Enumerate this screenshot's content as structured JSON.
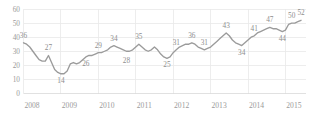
{
  "chart_data": {
    "type": "line",
    "title": "",
    "subtitle": "",
    "xlabel": "",
    "ylabel": "",
    "ylim": [
      0,
      60
    ],
    "ytick_values": [
      0,
      10,
      20,
      30,
      40,
      50,
      60
    ],
    "ytick_labels": [
      "0",
      "10",
      "20",
      "30",
      "40",
      "50",
      "60"
    ],
    "xtick_labels": [
      "2008",
      "2009",
      "2010",
      "2011",
      "2012",
      "2013",
      "2014",
      "2015"
    ],
    "xtick_positions": [
      2008,
      2009,
      2010,
      2011,
      2012,
      2013,
      2014,
      2015
    ],
    "grid": {
      "horizontal": true,
      "vertical": true
    },
    "legend": {
      "visible": false,
      "position": "none"
    },
    "line_color": "#9b9b9b",
    "grid_color": "#e8e8e8",
    "label_color": "#8e8e8e",
    "series": [
      {
        "name": "series-1",
        "x": [
          2008.0,
          2008.083,
          2008.167,
          2008.25,
          2008.333,
          2008.417,
          2008.5,
          2008.583,
          2008.667,
          2008.75,
          2008.833,
          2008.917,
          2009.0,
          2009.083,
          2009.167,
          2009.25,
          2009.333,
          2009.417,
          2009.5,
          2009.583,
          2009.667,
          2009.75,
          2009.833,
          2009.917,
          2010.0,
          2010.083,
          2010.167,
          2010.25,
          2010.333,
          2010.417,
          2010.5,
          2010.583,
          2010.667,
          2010.75,
          2010.833,
          2010.917,
          2011.0,
          2011.083,
          2011.167,
          2011.25,
          2011.333,
          2011.417,
          2011.5,
          2011.583,
          2011.667,
          2011.75,
          2011.833,
          2011.917,
          2012.0,
          2012.083,
          2012.167,
          2012.25,
          2012.333,
          2012.417,
          2012.5,
          2012.583,
          2012.667,
          2012.75,
          2012.833,
          2012.917,
          2013.0,
          2013.083,
          2013.167,
          2013.25,
          2013.333,
          2013.417,
          2013.5,
          2013.583,
          2013.667,
          2013.75,
          2013.833,
          2013.917,
          2014.0,
          2014.083,
          2014.167,
          2014.25,
          2014.333,
          2014.417,
          2014.5,
          2014.583,
          2014.667,
          2014.75,
          2014.833,
          2014.917,
          2015.0,
          2015.083,
          2015.167,
          2015.25,
          2015.333,
          2015.417
        ],
        "values": [
          36,
          35,
          33,
          30,
          27,
          24,
          23,
          23,
          27,
          22,
          17,
          15,
          14,
          14,
          16,
          21,
          22,
          21,
          22,
          24,
          26,
          27,
          27,
          28,
          29,
          29,
          30,
          31,
          33,
          34,
          33,
          32,
          31,
          30,
          30,
          31,
          33,
          35,
          33,
          31,
          30,
          31,
          33,
          31,
          28,
          26,
          25,
          26,
          29,
          31,
          33,
          34,
          35,
          35,
          36,
          35,
          33,
          32,
          31,
          32,
          33,
          35,
          37,
          39,
          41,
          43,
          41,
          38,
          36,
          35,
          34,
          36,
          38,
          40,
          41,
          43,
          44,
          45,
          46,
          47,
          46,
          46,
          45,
          44,
          45,
          49,
          50,
          50,
          51,
          52
        ]
      }
    ],
    "point_labels": [
      {
        "x": 2008.0,
        "value": 36,
        "text": "36",
        "position": "above"
      },
      {
        "x": 2008.667,
        "value": 27,
        "text": "27",
        "position": "above"
      },
      {
        "x": 2009.0,
        "value": 14,
        "text": "14",
        "position": "below"
      },
      {
        "x": 2009.667,
        "value": 26,
        "text": "26",
        "position": "below"
      },
      {
        "x": 2010.0,
        "value": 29,
        "text": "29",
        "position": "above"
      },
      {
        "x": 2010.417,
        "value": 34,
        "text": "34",
        "position": "above"
      },
      {
        "x": 2010.75,
        "value": 28,
        "text": "28",
        "position": "below"
      },
      {
        "x": 2011.083,
        "value": 35,
        "text": "35",
        "position": "above"
      },
      {
        "x": 2011.833,
        "value": 25,
        "text": "25",
        "position": "below"
      },
      {
        "x": 2012.083,
        "value": 31,
        "text": "31",
        "position": "above"
      },
      {
        "x": 2012.5,
        "value": 36,
        "text": "36",
        "position": "above"
      },
      {
        "x": 2012.833,
        "value": 31,
        "text": "31",
        "position": "above"
      },
      {
        "x": 2013.417,
        "value": 43,
        "text": "43",
        "position": "above"
      },
      {
        "x": 2013.833,
        "value": 34,
        "text": "34",
        "position": "below"
      },
      {
        "x": 2014.167,
        "value": 41,
        "text": "41",
        "position": "above"
      },
      {
        "x": 2014.583,
        "value": 47,
        "text": "47",
        "position": "above"
      },
      {
        "x": 2014.917,
        "value": 44,
        "text": "44",
        "position": "below"
      },
      {
        "x": 2015.167,
        "value": 50,
        "text": "50",
        "position": "above"
      },
      {
        "x": 2015.417,
        "value": 52,
        "text": "52",
        "position": "above"
      }
    ]
  }
}
